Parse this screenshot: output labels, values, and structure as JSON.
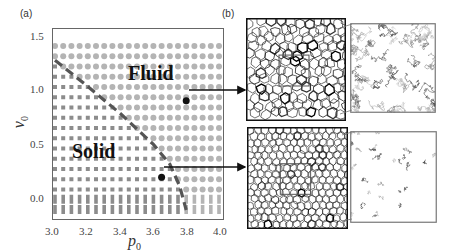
{
  "panels": {
    "a": {
      "label": "(a)"
    },
    "b": {
      "label": "(b)"
    }
  },
  "chart_data": {
    "type": "scatter",
    "title": "",
    "xlabel": "p0",
    "ylabel": "v0",
    "xlim": [
      3.0,
      4.0
    ],
    "ylim": [
      0.0,
      1.5
    ],
    "xticks": [
      "3.0",
      "3.2",
      "3.4",
      "3.6",
      "3.8",
      "4.0"
    ],
    "yticks": [
      "0.0",
      "0.5",
      "1.0",
      "1.5"
    ],
    "grid": false,
    "legend": null,
    "series": [
      {
        "name": "Solid",
        "marker": "square",
        "color": "#8c8c8c",
        "region": "below dashed boundary"
      },
      {
        "name": "Fluid",
        "marker": "circle",
        "color": "#b4b4b4",
        "region": "above dashed boundary"
      }
    ],
    "phase_boundary": {
      "style": "dashed",
      "color": "#555555",
      "points": [
        [
          3.0,
          1.37
        ],
        [
          3.2,
          1.13
        ],
        [
          3.4,
          0.88
        ],
        [
          3.6,
          0.6
        ],
        [
          3.7,
          0.42
        ],
        [
          3.76,
          0.22
        ],
        [
          3.8,
          0.0
        ]
      ]
    },
    "annotations": [
      {
        "text": "Fluid",
        "x": 3.55,
        "y": 1.15
      },
      {
        "text": "Solid",
        "x": 3.12,
        "y": 0.42
      }
    ],
    "highlighted_points": [
      {
        "x": 3.8,
        "y": 1.0,
        "phase": "Fluid",
        "links_to": "fluid-snapshot"
      },
      {
        "x": 3.65,
        "y": 0.3,
        "phase": "Solid",
        "links_to": "solid-snapshot"
      }
    ]
  },
  "labels": {
    "fluid": "Fluid",
    "solid": "Solid",
    "xlabel_main": "p",
    "xlabel_sub": "0",
    "ylabel_main": "v",
    "ylabel_sub": "0"
  },
  "snapshots": {
    "fluid": {
      "description": "Voronoi tessellation of fluid state with zoomed cell-trajectory inset"
    },
    "solid": {
      "description": "Voronoi tessellation of solid state with zoomed cell-trajectory inset"
    }
  }
}
